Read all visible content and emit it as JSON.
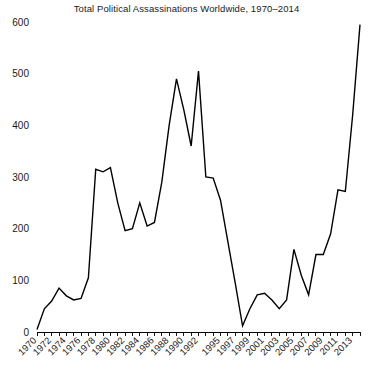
{
  "chart_data": {
    "type": "line",
    "title": "Total Political Assassinations Worldwide, 1970–2014",
    "xlabel": "",
    "ylabel": "",
    "xlim": [
      1970,
      2014
    ],
    "ylim": [
      0,
      600
    ],
    "grid": false,
    "legend": null,
    "line_color": "#000000",
    "y_ticks": [
      0,
      100,
      200,
      300,
      400,
      500,
      600
    ],
    "y_tick_labels": [
      "0",
      "100",
      "200",
      "300",
      "400",
      "500",
      "600"
    ],
    "x_tick_labels": [
      "1970",
      "1972",
      "1974",
      "1976",
      "1978",
      "1980",
      "1982",
      "1984",
      "1986",
      "1988",
      "1990",
      "1992",
      "1995",
      "1997",
      "1999",
      "2001",
      "2003",
      "2005",
      "2007",
      "2009",
      "2011",
      "2013"
    ],
    "x_tick_label_years": [
      1970,
      1972,
      1974,
      1976,
      1978,
      1980,
      1982,
      1984,
      1986,
      1988,
      1990,
      1992,
      1995,
      1997,
      1999,
      2001,
      2003,
      2005,
      2007,
      2009,
      2011,
      2013
    ],
    "x_minor_tick_years": [
      1970,
      1971,
      1972,
      1973,
      1974,
      1975,
      1976,
      1977,
      1978,
      1979,
      1980,
      1981,
      1982,
      1983,
      1984,
      1985,
      1986,
      1987,
      1988,
      1989,
      1990,
      1991,
      1992,
      1993,
      1994,
      1995,
      1996,
      1997,
      1998,
      1999,
      2000,
      2001,
      2002,
      2003,
      2004,
      2005,
      2006,
      2007,
      2008,
      2009,
      2010,
      2011,
      2012,
      2013,
      2014
    ],
    "x": [
      1970,
      1971,
      1972,
      1973,
      1974,
      1975,
      1976,
      1977,
      1978,
      1979,
      1980,
      1981,
      1982,
      1983,
      1984,
      1985,
      1986,
      1987,
      1988,
      1989,
      1990,
      1991,
      1992,
      1993,
      1994,
      1995,
      1996,
      1997,
      1998,
      1999,
      2000,
      2001,
      2002,
      2003,
      2004,
      2005,
      2006,
      2007,
      2008,
      2009,
      2010,
      2011,
      2012,
      2013,
      2014
    ],
    "values": [
      5,
      45,
      60,
      85,
      70,
      62,
      65,
      105,
      315,
      310,
      318,
      250,
      196,
      200,
      250,
      205,
      212,
      290,
      400,
      490,
      430,
      360,
      505,
      300,
      298,
      255,
      175,
      95,
      12,
      45,
      72,
      75,
      62,
      45,
      62,
      160,
      110,
      72,
      150,
      150,
      190,
      275,
      272,
      420,
      595
    ],
    "series": [
      {
        "name": "Total political assassinations",
        "values": [
          5,
          45,
          60,
          85,
          70,
          62,
          65,
          105,
          315,
          310,
          318,
          250,
          196,
          200,
          250,
          205,
          212,
          290,
          400,
          490,
          430,
          360,
          505,
          300,
          298,
          255,
          175,
          95,
          12,
          45,
          72,
          75,
          62,
          45,
          62,
          160,
          110,
          72,
          150,
          150,
          190,
          275,
          272,
          420,
          595
        ]
      }
    ]
  }
}
